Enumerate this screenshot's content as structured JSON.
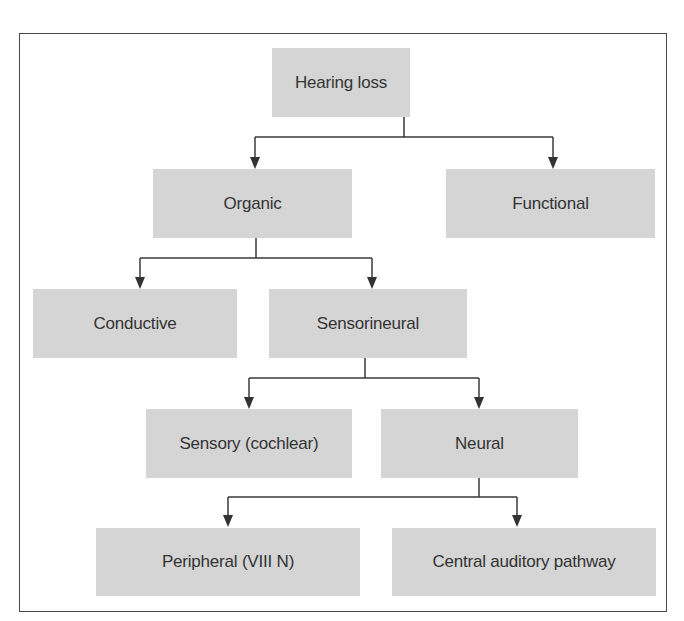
{
  "nodes": {
    "hearing_loss": "Hearing loss",
    "organic": "Organic",
    "functional": "Functional",
    "conductive": "Conductive",
    "sensorineural": "Sensorineural",
    "sensory": "Sensory (cochlear)",
    "neural": "Neural",
    "peripheral": "Peripheral (VIII N)",
    "central": "Central auditory pathway"
  },
  "edges": [
    [
      "Hearing loss",
      "Organic"
    ],
    [
      "Hearing loss",
      "Functional"
    ],
    [
      "Organic",
      "Conductive"
    ],
    [
      "Organic",
      "Sensorineural"
    ],
    [
      "Sensorineural",
      "Sensory (cochlear)"
    ],
    [
      "Sensorineural",
      "Neural"
    ],
    [
      "Neural",
      "Peripheral (VIII N)"
    ],
    [
      "Neural",
      "Central auditory pathway"
    ]
  ],
  "colors": {
    "node_fill": "#d5d5d5",
    "text": "#333333",
    "line": "#3a3a3a"
  }
}
